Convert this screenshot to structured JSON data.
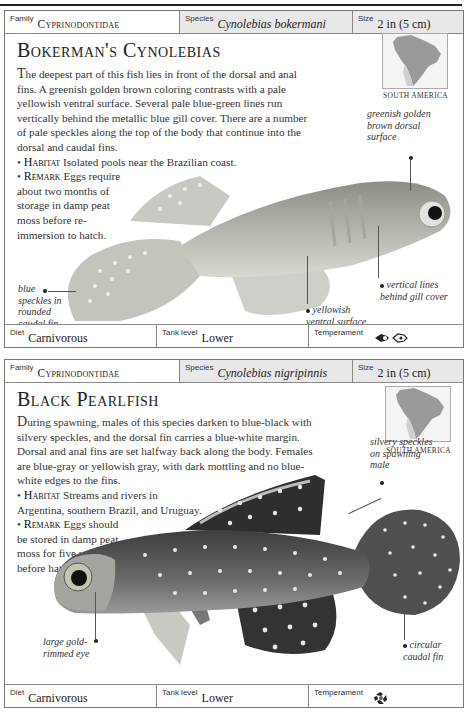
{
  "entries": [
    {
      "family_label": "Family",
      "family": "Cyprinodontidae",
      "species_label": "Species",
      "species": "Cynolebias bokermani",
      "size_label": "Size",
      "size": "2 in (5 cm)",
      "title": "Bokerman's Cynolebias",
      "description_first_letter": "T",
      "description": "he deepest part of this fish lies in front of the dorsal and anal fins. A greenish golden brown coloring contrasts with a pale yellowish ventral surface. Several pale blue-green lines run vertically behind the metallic blue gill cover. There are a number of pale speckles along the top of the body that continue into the dorsal and caudal fins.",
      "habitat_label": "Habitat",
      "habitat": "Isolated pools near the Brazilian coast.",
      "remark_label": "Remark",
      "remark": "Eggs require about two months of storage in damp peat moss before re-immersion to hatch.",
      "map_label": "SOUTH AMERICA",
      "annotations": [
        "greenish golden brown dorsal surface",
        "vertical lines behind gill cover",
        "yellowish ventral surface",
        "blue speckles in rounded caudal fin"
      ],
      "diet_label": "Diet",
      "diet": "Carnivorous",
      "tank_label": "Tank level",
      "tank": "Lower",
      "temperament_label": "Temperament",
      "temperament_icon": "peaceful-fish-group-icon"
    },
    {
      "family_label": "Family",
      "family": "Cyprinodontidae",
      "species_label": "Species",
      "species": "Cynolebias nigripinnis",
      "size_label": "Size",
      "size": "2 in (5 cm)",
      "title": "Black Pearlfish",
      "description_first_letter": "D",
      "description": "uring spawning, males of this species darken to blue-black with silvery speckles, and the dorsal fin carries a blue-white margin. Dorsal and anal fins are set halfway back along the body. Females are blue-gray or yellowish gray, with dark mottling and no blue-white edges to the fins.",
      "habitat_label": "Habitat",
      "habitat": "Streams and rivers in Argentina, southern Brazil, and Uruguay.",
      "remark_label": "Remark",
      "remark": "Eggs should be stored in damp peat moss for five weeks before hatching.",
      "map_label": "SOUTH AMERICA",
      "annotations": [
        "silvery speckles on spawning male",
        "large gold-rimmed eye",
        "circular caudal fin"
      ],
      "diet_label": "Diet",
      "diet": "Carnivorous",
      "tank_label": "Tank level",
      "tank": "Lower",
      "temperament_label": "Temperament",
      "temperament_icon": "aggressive-fish-circle-icon"
    }
  ]
}
